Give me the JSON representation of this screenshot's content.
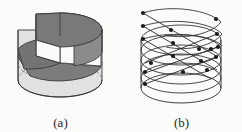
{
  "figure": {
    "background_color": "#fdfdfc",
    "ink_color": "#2b2b2b",
    "dark_fill": "#808080",
    "mid_fill": "#9a9a9a",
    "light_fill": "#e3e3e3",
    "white_fill": "#fdfdfd",
    "panels": [
      {
        "id": "a",
        "caption": "(a)",
        "subject": "solid-cylinder-with-helicoid-ramp",
        "description": "Opaque circular cylinder cut by a helicoidal ramp surface; shaded top sector, white underside of the ramp, light-gray cylinder wall and hidden dashed base circle.",
        "geometry": {
          "center_x": 60,
          "top_ellipse_cy": 30,
          "bottom_ellipse_cy": 80,
          "rx": 42,
          "ry": 17,
          "wall_height": 50,
          "ramp_turns": 1
        }
      },
      {
        "id": "b",
        "caption": "(b)",
        "subject": "cylinder-with-helix-and-marked-points",
        "description": "Transparent circular cylinder drawn as a stack of ellipse level-curves crossed by straight chord segments; filled round dots mark the sample points where the helical path meets each level.",
        "geometry": {
          "center_x": 60,
          "top_ellipse_cy": 30,
          "bottom_ellipse_cy": 88,
          "rx": 40,
          "ry": 16,
          "level_count": 6,
          "chord_count": 5,
          "dot_radius": 2.1
        },
        "level_curve_cy": [
          30,
          42,
          54,
          66,
          76,
          88
        ],
        "dots": [
          {
            "x": 22,
            "y": 13
          },
          {
            "x": 22,
            "y": 26
          },
          {
            "x": 22,
            "y": 39
          },
          {
            "x": 50,
            "y": 30
          },
          {
            "x": 52,
            "y": 43
          },
          {
            "x": 52,
            "y": 56
          },
          {
            "x": 78,
            "y": 49
          },
          {
            "x": 80,
            "y": 61
          },
          {
            "x": 95,
            "y": 19
          },
          {
            "x": 96,
            "y": 34
          },
          {
            "x": 97,
            "y": 47
          },
          {
            "x": 95,
            "y": 57
          },
          {
            "x": 90,
            "y": 49
          },
          {
            "x": 30,
            "y": 63
          },
          {
            "x": 24,
            "y": 72
          },
          {
            "x": 24,
            "y": 84
          },
          {
            "x": 62,
            "y": 72
          },
          {
            "x": 86,
            "y": 70
          }
        ]
      }
    ]
  }
}
